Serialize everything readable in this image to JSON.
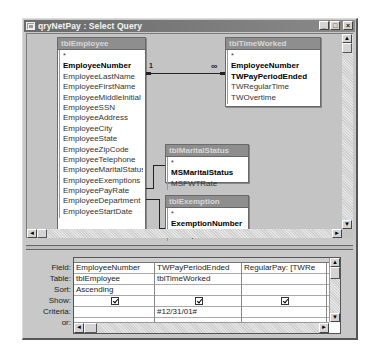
{
  "window": {
    "title": "qryNetPay : Select Query",
    "icon": "query-icon",
    "buttons": {
      "minimize": "_",
      "maximize": "□",
      "close": "×"
    }
  },
  "tables": {
    "employee": {
      "name": "tblEmployee",
      "fields": [
        "*",
        "EmployeeNumber",
        "EmployeeLastName",
        "EmployeeFirstName",
        "EmployeeMiddleInitial",
        "EmployeeSSN",
        "EmployeeAddress",
        "EmployeeCity",
        "EmployeeState",
        "EmployeeZipCode",
        "EmployeeTelephone",
        "EmployeeMaritalStatus",
        "EmployeeExemptions",
        "EmployeePayRate",
        "EmployeeDepartment",
        "EmployeeStartDate"
      ],
      "primary_keys": [
        "EmployeeNumber"
      ]
    },
    "timeworked": {
      "name": "tblTimeWorked",
      "fields": [
        "*",
        "EmployeeNumber",
        "TWPayPeriodEnded",
        "TWRegularTime",
        "TWOvertime"
      ],
      "primary_keys": [
        "EmployeeNumber",
        "TWPayPeriodEnded"
      ]
    },
    "maritalstatus": {
      "name": "tblMaritalStatus",
      "fields": [
        "*",
        "MSMaritalStatus",
        "MSFWTRate"
      ],
      "primary_keys": [
        "MSMaritalStatus"
      ]
    },
    "exemption": {
      "name": "tblExemption",
      "fields": [
        "*",
        "ExemptionNumber",
        "ExemptionAmount"
      ],
      "primary_keys": [
        "ExemptionNumber"
      ]
    }
  },
  "relationships": [
    {
      "from": "tblEmployee.EmployeeNumber",
      "to": "tblTimeWorked.EmployeeNumber",
      "one_label": "1",
      "many_label": "∞"
    },
    {
      "from": "tblEmployee.EmployeeMaritalStatus",
      "to": "tblMaritalStatus.MSMaritalStatus"
    },
    {
      "from": "tblEmployee.EmployeeExemptions",
      "to": "tblExemption.ExemptionNumber"
    }
  ],
  "grid": {
    "row_labels": [
      "Field:",
      "Table:",
      "Sort:",
      "Show:",
      "Criteria:",
      "or:"
    ],
    "columns": [
      {
        "field": "EmployeeNumber",
        "table": "tblEmployee",
        "sort": "Ascending",
        "show": true,
        "criteria": "",
        "or": ""
      },
      {
        "field": "TWPayPeriodEnded",
        "table": "tblTimeWorked",
        "sort": "",
        "show": true,
        "criteria": "#12/31/01#",
        "or": ""
      },
      {
        "field": "RegularPay: [TWRe",
        "table": "",
        "sort": "",
        "show": true,
        "criteria": "",
        "or": ""
      },
      {
        "field": "Ove",
        "table": "",
        "sort": "",
        "show": false,
        "criteria": "",
        "or": ""
      }
    ]
  },
  "scroll": {
    "up": "▲",
    "down": "▼",
    "left": "◄",
    "right": "►"
  }
}
